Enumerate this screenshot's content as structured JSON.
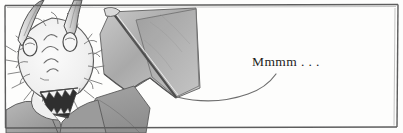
{
  "panel": {
    "name": "comic-panel",
    "width": 403,
    "height": 133,
    "border_color": "#5d5d5d",
    "background_color": "#fdfdfc",
    "ink_color": "#4a4a4a",
    "shade_light": "#e6e6e6",
    "shade_mid": "#b9b9b9",
    "shade_dark": "#8c8c8c",
    "shade_darkest": "#3a3a3a"
  },
  "caption": {
    "text": "Mmmm . . ."
  },
  "figure": {
    "parts": [
      "left-horn",
      "right-horn",
      "left-eye",
      "right-eye",
      "snout",
      "fur-ruff",
      "open-mouth-with-teeth",
      "shoulder",
      "wing-membrane",
      "wing-strut"
    ]
  },
  "balloon": {
    "tail": "curved-speech-tail"
  }
}
